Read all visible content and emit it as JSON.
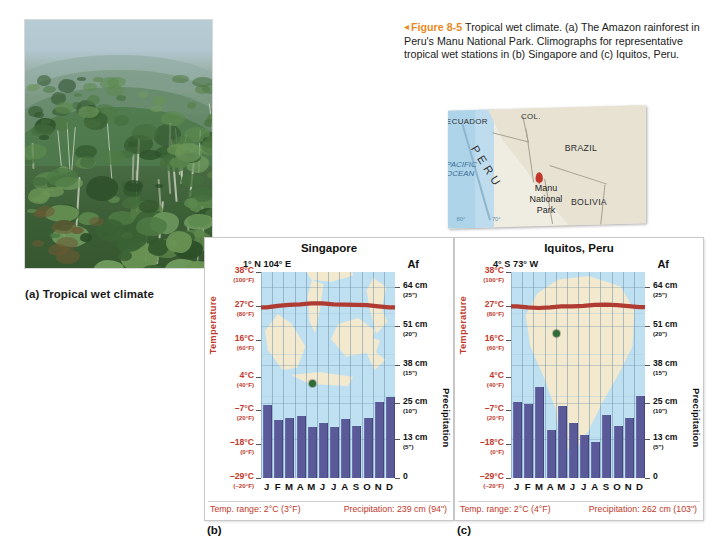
{
  "figure": {
    "marker": "◂",
    "number": "Figure 8-5",
    "caption": "Tropical wet climate. (a) The Amazon rainforest in Peru's Manu National Park. Climographs for representative tropical wet stations in (b) Singapore and (c) Iquitos, Peru.",
    "accent_color": "#e98a1e"
  },
  "photo": {
    "caption": "(a) Tropical wet climate",
    "alt": "Amazon rainforest canopy with mist-covered ridges"
  },
  "map": {
    "countries": [
      "ECUADOR",
      "COL.",
      "BRAZIL",
      "BOLIVIA"
    ],
    "focus_country": "PERU",
    "ocean_label": "PACIFIC\nOCEAN",
    "ocean_label_line1": "PACIFIC",
    "ocean_label_line2": "OCEAN",
    "site_label": "Manu\nNational\nPark",
    "site_label_line1": "Manu",
    "site_label_line2": "National",
    "site_label_line3": "Park",
    "grid_labels": [
      "80°",
      "70°"
    ],
    "pin_color": "#c2352b",
    "land_color": "#e7e2d2",
    "ocean_color": "#aed4ea"
  },
  "panels": {
    "b_letter": "(b)",
    "c_letter": "(c)"
  },
  "axes": {
    "temperature_title": "Temperature",
    "precipitation_title": "Precipitation",
    "temperature_ticks": [
      {
        "c": "38°C",
        "f": "(100°F)"
      },
      {
        "c": "27°C",
        "f": "(80°F)"
      },
      {
        "c": "16°C",
        "f": "(60°F)"
      },
      {
        "c": "4°C",
        "f": "(40°F)"
      },
      {
        "c": "–7°C",
        "f": "(20°F)"
      },
      {
        "c": "–18°C",
        "f": "(0°F)"
      },
      {
        "c": "–29°C",
        "f": "(–20°F)"
      }
    ],
    "precipitation_ticks": [
      {
        "cm": "64 cm",
        "in": "(25\")"
      },
      {
        "cm": "51 cm",
        "in": "(20\")"
      },
      {
        "cm": "38 cm",
        "in": "(15\")"
      },
      {
        "cm": "25 cm",
        "in": "(10\")"
      },
      {
        "cm": "13 cm",
        "in": "(5\")"
      },
      {
        "cm": "0",
        "in": ""
      }
    ],
    "months": [
      "J",
      "F",
      "M",
      "A",
      "M",
      "J",
      "J",
      "A",
      "S",
      "O",
      "N",
      "D"
    ]
  },
  "colors": {
    "temp_line": "#b03b32",
    "bar": "#5b5a99",
    "plot_water": "#bfe0f0",
    "plot_land": "#f2e9cf",
    "site_dot": "#2f6b36"
  },
  "chart_data": [
    {
      "type": "bar",
      "id": "singapore",
      "title": "Singapore",
      "coords": "1° N  104° E",
      "climate_code": "Af",
      "categories": [
        "J",
        "F",
        "M",
        "A",
        "M",
        "J",
        "J",
        "A",
        "S",
        "O",
        "N",
        "D"
      ],
      "xlabel": "",
      "ylabel": "Precipitation",
      "ylabel_secondary": "Temperature",
      "ylim": [
        0,
        69
      ],
      "precip_cm": [
        24.5,
        19.5,
        20.0,
        20.8,
        17.0,
        18.5,
        17.0,
        19.8,
        17.5,
        20.2,
        25.5,
        27.0
      ],
      "temp_c": [
        26.5,
        27.0,
        27.3,
        27.5,
        27.8,
        27.8,
        27.5,
        27.4,
        27.3,
        27.2,
        26.8,
        26.5
      ],
      "temp_ylim": [
        -29,
        38
      ],
      "temp_range_label": "Temp. range: 2°C (3°F)",
      "precip_total_label": "Precipitation: 239 cm (94\")",
      "panel_letter": "(b)",
      "grid": true,
      "legend": "none"
    },
    {
      "type": "bar",
      "id": "iquitos",
      "title": "Iquitos, Peru",
      "coords": "4° S  73° W",
      "climate_code": "Af",
      "categories": [
        "J",
        "F",
        "M",
        "A",
        "M",
        "J",
        "J",
        "A",
        "S",
        "O",
        "N",
        "D"
      ],
      "xlabel": "",
      "ylabel": "Precipitation",
      "ylabel_secondary": "Temperature",
      "ylim": [
        0,
        69
      ],
      "precip_cm": [
        25.5,
        24.8,
        30.5,
        16.0,
        24.2,
        18.5,
        14.5,
        12.2,
        21.0,
        17.5,
        20.0,
        27.5
      ],
      "temp_c": [
        26.8,
        26.5,
        26.3,
        26.5,
        26.8,
        26.8,
        27.0,
        27.3,
        27.4,
        27.2,
        26.9,
        26.6
      ],
      "temp_ylim": [
        -29,
        38
      ],
      "temp_range_label": "Temp. range: 2°C (4°F)",
      "precip_total_label": "Precipitation: 262 cm (103\")",
      "panel_letter": "(c)",
      "grid": true,
      "legend": "none"
    }
  ]
}
